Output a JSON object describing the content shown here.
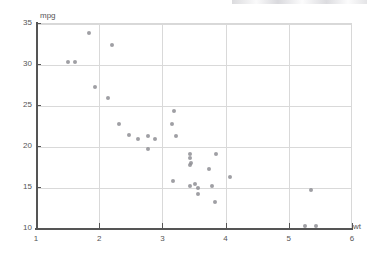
{
  "chart_data": {
    "type": "scatter",
    "title": "",
    "subtitle": "",
    "xlabel": "wt",
    "ylabel": "mpg",
    "xlim": [
      1,
      6
    ],
    "ylim": [
      10,
      35
    ],
    "grid": true,
    "legend": false,
    "x_ticks": [
      1,
      2,
      3,
      4,
      5,
      6
    ],
    "x_tick_labels": [
      "1",
      "2",
      "3",
      "4",
      "5",
      "6"
    ],
    "y_ticks": [
      10,
      15,
      20,
      25,
      30,
      35
    ],
    "y_tick_labels": [
      "10",
      "15",
      "20",
      "25",
      "30",
      "35"
    ],
    "marker_color": "#8e8e94",
    "grid_color": "#d9d9d9",
    "axis_color": "#555555",
    "background_color": "#ffffff",
    "x": [
      2.62,
      2.875,
      2.32,
      3.215,
      3.44,
      3.46,
      3.57,
      3.19,
      3.15,
      3.44,
      3.44,
      4.07,
      3.73,
      3.78,
      5.25,
      5.424,
      5.345,
      2.2,
      1.615,
      1.835,
      2.465,
      3.52,
      3.435,
      3.84,
      3.845,
      1.935,
      2.14,
      1.513,
      3.17,
      2.77,
      3.57,
      2.78
    ],
    "y": [
      21.0,
      21.0,
      22.8,
      21.4,
      18.7,
      18.1,
      14.3,
      24.4,
      22.8,
      19.2,
      17.8,
      16.4,
      17.3,
      15.2,
      10.4,
      10.4,
      14.7,
      32.4,
      30.4,
      33.9,
      21.5,
      15.5,
      15.2,
      13.3,
      19.2,
      27.3,
      26.0,
      30.4,
      15.8,
      19.7,
      15.0,
      21.4
    ],
    "points": [
      {
        "x": 2.62,
        "y": 21.0
      },
      {
        "x": 2.875,
        "y": 21.0
      },
      {
        "x": 2.32,
        "y": 22.8
      },
      {
        "x": 3.215,
        "y": 21.4
      },
      {
        "x": 3.44,
        "y": 18.7
      },
      {
        "x": 3.46,
        "y": 18.1
      },
      {
        "x": 3.57,
        "y": 14.3
      },
      {
        "x": 3.19,
        "y": 24.4
      },
      {
        "x": 3.15,
        "y": 22.8
      },
      {
        "x": 3.44,
        "y": 19.2
      },
      {
        "x": 3.44,
        "y": 17.8
      },
      {
        "x": 4.07,
        "y": 16.4
      },
      {
        "x": 3.73,
        "y": 17.3
      },
      {
        "x": 3.78,
        "y": 15.2
      },
      {
        "x": 5.25,
        "y": 10.4
      },
      {
        "x": 5.424,
        "y": 10.4
      },
      {
        "x": 5.345,
        "y": 14.7
      },
      {
        "x": 2.2,
        "y": 32.4
      },
      {
        "x": 1.615,
        "y": 30.4
      },
      {
        "x": 1.835,
        "y": 33.9
      },
      {
        "x": 2.465,
        "y": 21.5
      },
      {
        "x": 3.52,
        "y": 15.5
      },
      {
        "x": 3.435,
        "y": 15.2
      },
      {
        "x": 3.84,
        "y": 13.3
      },
      {
        "x": 3.845,
        "y": 19.2
      },
      {
        "x": 1.935,
        "y": 27.3
      },
      {
        "x": 2.14,
        "y": 26.0
      },
      {
        "x": 1.513,
        "y": 30.4
      },
      {
        "x": 3.17,
        "y": 15.8
      },
      {
        "x": 2.77,
        "y": 19.7
      },
      {
        "x": 3.57,
        "y": 15.0
      },
      {
        "x": 2.78,
        "y": 21.4
      }
    ]
  }
}
